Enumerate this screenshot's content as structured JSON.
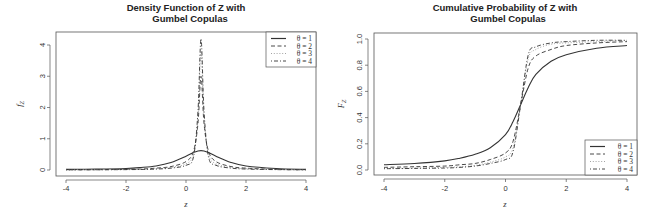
{
  "chart_data": [
    {
      "type": "line",
      "title": "Density Function of Z with\nGumbel Copulas",
      "title_lines": [
        "Density Function of Z with",
        "Gumbel Copulas"
      ],
      "xlabel": "z",
      "ylabel": "f_Z",
      "xlim": [
        -4,
        4
      ],
      "ylim": [
        0,
        4.2
      ],
      "xticks": [
        -4,
        -2,
        0,
        2,
        4
      ],
      "yticks": [
        0,
        1,
        2,
        3,
        4
      ],
      "grid": false,
      "legend_position": "top-right",
      "x": [
        -4,
        -3,
        -2,
        -1.5,
        -1,
        -0.5,
        0,
        0.25,
        0.4,
        0.5,
        0.6,
        0.75,
        1,
        1.5,
        2,
        3,
        4
      ],
      "series": [
        {
          "name": "θ = 1",
          "style": "solid",
          "values": [
            0.02,
            0.03,
            0.05,
            0.08,
            0.13,
            0.24,
            0.44,
            0.56,
            0.61,
            0.62,
            0.61,
            0.56,
            0.44,
            0.24,
            0.13,
            0.05,
            0.02
          ]
        },
        {
          "name": "θ = 2",
          "style": "dashed",
          "values": [
            0.01,
            0.01,
            0.02,
            0.03,
            0.06,
            0.11,
            0.27,
            0.6,
            1.5,
            3.0,
            1.5,
            0.6,
            0.27,
            0.11,
            0.06,
            0.02,
            0.01
          ]
        },
        {
          "name": "θ = 3",
          "style": "dotted",
          "values": [
            0.005,
            0.01,
            0.015,
            0.02,
            0.04,
            0.08,
            0.2,
            0.5,
            1.7,
            3.8,
            1.7,
            0.5,
            0.2,
            0.08,
            0.04,
            0.015,
            0.005
          ]
        },
        {
          "name": "θ = 4",
          "style": "dotdash",
          "values": [
            0.004,
            0.008,
            0.012,
            0.018,
            0.03,
            0.06,
            0.15,
            0.42,
            1.9,
            4.2,
            1.9,
            0.42,
            0.15,
            0.06,
            0.03,
            0.012,
            0.004
          ]
        }
      ]
    },
    {
      "type": "line",
      "title": "Cumulative Probability of Z with\nGumbel Copulas",
      "title_lines": [
        "Cumulative Probability of Z with",
        "Gumbel Copulas"
      ],
      "xlabel": "z",
      "ylabel": "F_Z",
      "xlim": [
        -4,
        4
      ],
      "ylim": [
        0,
        1
      ],
      "xticks": [
        -4,
        -2,
        0,
        2,
        4
      ],
      "yticks": [
        0.0,
        0.2,
        0.4,
        0.6,
        0.8,
        1.0
      ],
      "ytick_labels": [
        "0.0",
        "0.2",
        "0.4",
        "0.6",
        "0.8",
        "1.0"
      ],
      "grid": false,
      "legend_position": "bottom-right",
      "x": [
        -4,
        -3,
        -2,
        -1.5,
        -1,
        -0.5,
        0,
        0.25,
        0.5,
        0.75,
        1,
        1.5,
        2,
        3,
        4
      ],
      "series": [
        {
          "name": "θ = 1",
          "style": "solid",
          "values": [
            0.04,
            0.05,
            0.07,
            0.09,
            0.12,
            0.17,
            0.27,
            0.37,
            0.5,
            0.63,
            0.73,
            0.83,
            0.88,
            0.93,
            0.95
          ]
        },
        {
          "name": "θ = 2",
          "style": "dashed",
          "values": [
            0.02,
            0.025,
            0.03,
            0.04,
            0.05,
            0.08,
            0.13,
            0.22,
            0.5,
            0.78,
            0.87,
            0.92,
            0.95,
            0.97,
            0.98
          ]
        },
        {
          "name": "θ = 3",
          "style": "dotted",
          "values": [
            0.01,
            0.015,
            0.02,
            0.025,
            0.035,
            0.06,
            0.1,
            0.17,
            0.5,
            0.85,
            0.92,
            0.96,
            0.97,
            0.98,
            0.99
          ]
        },
        {
          "name": "θ = 4",
          "style": "dotdash",
          "values": [
            0.01,
            0.012,
            0.015,
            0.02,
            0.03,
            0.05,
            0.08,
            0.14,
            0.5,
            0.88,
            0.94,
            0.97,
            0.98,
            0.99,
            0.99
          ]
        }
      ]
    }
  ],
  "colors": {
    "axis": "#555555",
    "line": "#333333",
    "background": "#ffffff"
  }
}
